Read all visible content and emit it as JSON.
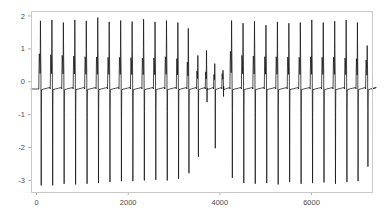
{
  "chart_data": {
    "type": "line",
    "title": "",
    "subtitle": "",
    "xlabel": "",
    "ylabel": "",
    "xlim": [
      -120,
      7320
    ],
    "ylim": [
      -3.35,
      2.15
    ],
    "xticks": [
      0,
      2000,
      4000,
      6000
    ],
    "xticklabels": [
      "0",
      "2000",
      "4000",
      "6000"
    ],
    "yticks": [
      2,
      1,
      0,
      -1,
      -2,
      -3
    ],
    "yticklabels": [
      "2",
      "1",
      "0",
      "-1",
      "-2",
      "-3"
    ],
    "grid": false,
    "legend": null,
    "line_color": "#101010",
    "frame_color": "#c9c9c9",
    "annotations": [],
    "series": [
      {
        "name": "signal",
        "color": "#101010",
        "bursts": [
          {
            "t": 60,
            "shoulder": 0.85,
            "peak": 1.85,
            "trough": -3.15
          },
          {
            "t": 310,
            "shoulder": 0.82,
            "peak": 1.88,
            "trough": -3.15
          },
          {
            "t": 560,
            "shoulder": 0.8,
            "peak": 1.8,
            "trough": -3.1
          },
          {
            "t": 810,
            "shoulder": 0.78,
            "peak": 1.88,
            "trough": -3.12
          },
          {
            "t": 1060,
            "shoulder": 0.76,
            "peak": 1.85,
            "trough": -3.1
          },
          {
            "t": 1310,
            "shoulder": 0.75,
            "peak": 1.95,
            "trough": -3.08
          },
          {
            "t": 1560,
            "shoulder": 0.74,
            "peak": 1.82,
            "trough": -3.05
          },
          {
            "t": 1810,
            "shoulder": 0.74,
            "peak": 1.86,
            "trough": -3.02
          },
          {
            "t": 2060,
            "shoulder": 0.73,
            "peak": 1.83,
            "trough": -3.02
          },
          {
            "t": 2310,
            "shoulder": 0.72,
            "peak": 1.9,
            "trough": -3.0
          },
          {
            "t": 2560,
            "shoulder": 0.72,
            "peak": 1.82,
            "trough": -2.98
          },
          {
            "t": 2810,
            "shoulder": 0.76,
            "peak": 1.86,
            "trough": -3.0
          },
          {
            "t": 3060,
            "shoulder": 0.7,
            "peak": 1.8,
            "trough": -2.95
          },
          {
            "t": 3290,
            "shoulder": 0.6,
            "peak": 1.62,
            "trough": -2.78
          },
          {
            "t": 3500,
            "shoulder": 0.33,
            "peak": 0.8,
            "trough": -2.28
          },
          {
            "t": 3690,
            "shoulder": 0.3,
            "peak": 0.95,
            "trough": -0.62
          },
          {
            "t": 3870,
            "shoulder": 0.22,
            "peak": 0.55,
            "trough": -2.02
          },
          {
            "t": 4050,
            "shoulder": 0.25,
            "peak": 0.35,
            "trough": -0.45
          },
          {
            "t": 4230,
            "shoulder": 0.92,
            "peak": 1.86,
            "trough": -2.92
          },
          {
            "t": 4480,
            "shoulder": 0.8,
            "peak": 1.78,
            "trough": -3.08
          },
          {
            "t": 4730,
            "shoulder": 0.78,
            "peak": 1.84,
            "trough": -3.1
          },
          {
            "t": 4980,
            "shoulder": 0.76,
            "peak": 1.72,
            "trough": -3.08
          },
          {
            "t": 5230,
            "shoulder": 0.76,
            "peak": 1.82,
            "trough": -3.12
          },
          {
            "t": 5480,
            "shoulder": 0.75,
            "peak": 1.78,
            "trough": -3.05
          },
          {
            "t": 5730,
            "shoulder": 0.74,
            "peak": 1.8,
            "trough": -3.1
          },
          {
            "t": 5980,
            "shoulder": 0.76,
            "peak": 1.88,
            "trough": -3.08
          },
          {
            "t": 6230,
            "shoulder": 0.74,
            "peak": 1.8,
            "trough": -3.06
          },
          {
            "t": 6480,
            "shoulder": 0.74,
            "peak": 1.84,
            "trough": -3.1
          },
          {
            "t": 6730,
            "shoulder": 0.72,
            "peak": 1.88,
            "trough": -3.05
          },
          {
            "t": 6980,
            "shoulder": 0.7,
            "peak": 1.8,
            "trough": -3.02
          },
          {
            "t": 7190,
            "shoulder": 0.66,
            "peak": 1.1,
            "trough": -2.58
          }
        ],
        "baseline": -0.22
      }
    ]
  },
  "layout": {
    "plot_left": 31,
    "plot_top": 11,
    "plot_right": 372,
    "plot_bottom": 192
  }
}
